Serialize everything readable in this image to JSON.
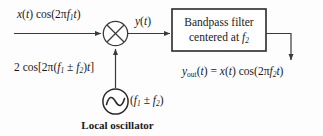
{
  "diagram": {
    "background_color": "#fdfdfd",
    "line_color": "#3a3a3a",
    "text_color": "#1a1a1a"
  },
  "labels": {
    "input_signal": "x(t) cos(2πf₁t)",
    "mixer_output": "y(t)",
    "oscillator_drive": "2 cos[2π(f₁ ± f₂)t]",
    "oscillator_frequency": "(f₁ ± f₂)",
    "output_signal": "yₒᵤₜ(t) = x(t) cos(2πf₂t)",
    "caption": "Local oscillator"
  },
  "filter_block": {
    "line1": "Bandpass filter",
    "line2": "centered at f₂"
  },
  "symbols": {
    "mixer": "⊗",
    "oscillator": "sine-wave-source"
  }
}
